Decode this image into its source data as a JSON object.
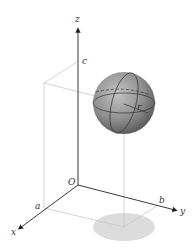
{
  "figure": {
    "labels": {
      "z_axis": "z",
      "x_axis": "x",
      "y_axis": "y",
      "origin": "O",
      "a": "a",
      "b": "b",
      "c": "c",
      "radius": "r"
    },
    "colors": {
      "axis": "#222222",
      "guide": "#c8c8c8",
      "sphere": "#8a8a8a",
      "shadow": "#dcdcdc"
    }
  }
}
